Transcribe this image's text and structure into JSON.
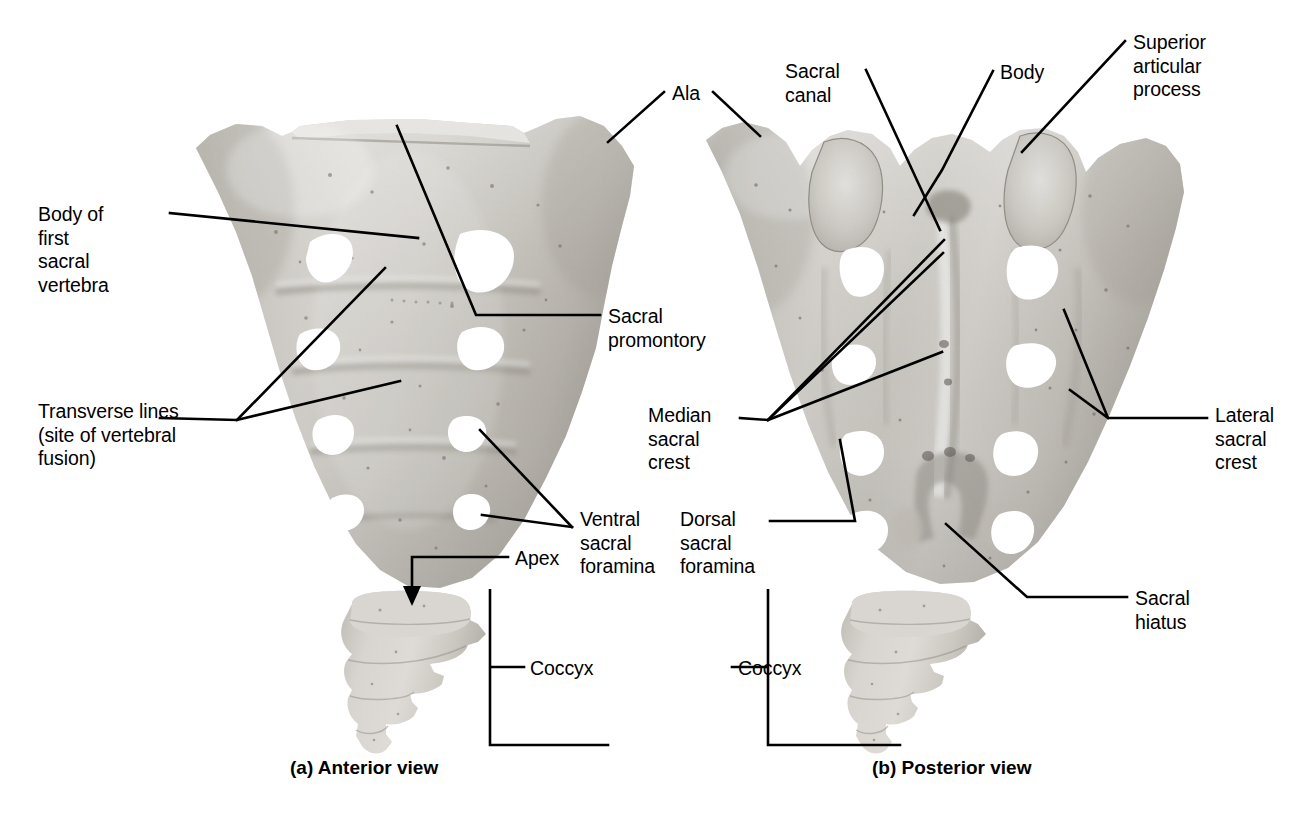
{
  "figure": {
    "background_color": "#ffffff",
    "line_color": "#000000",
    "bone_color": "#c9c6c0",
    "bone_shadow_color": "#9a968f",
    "bone_highlight_color": "#e2e0db",
    "foramen_color": "#ffffff"
  },
  "panels": [
    {
      "id": "anterior",
      "caption": "(a) Anterior view",
      "caption_x": 290,
      "caption_y": 757
    },
    {
      "id": "posterior",
      "caption": "(b) Posterior view",
      "caption_x": 872,
      "caption_y": 757
    }
  ],
  "labels": [
    {
      "name": "body-of-first-sacral-vertebra",
      "text": "Body of\nfirst\nsacral\nvertebra",
      "x": 38,
      "y": 203,
      "align": "left",
      "panel": "anterior"
    },
    {
      "name": "transverse-lines",
      "text": "Transverse lines\n(site of vertebral\nfusion)",
      "x": 38,
      "y": 400,
      "align": "left",
      "panel": "anterior"
    },
    {
      "name": "sacral-promontory",
      "text": "Sacral\npromontory",
      "x": 608,
      "y": 305,
      "align": "left",
      "panel": "anterior"
    },
    {
      "name": "ventral-sacral-foramina",
      "text": "Ventral\nsacral\nforamina",
      "x": 580,
      "y": 508,
      "align": "left",
      "panel": "anterior"
    },
    {
      "name": "apex",
      "text": "Apex",
      "x": 515,
      "y": 547,
      "align": "left",
      "panel": "anterior"
    },
    {
      "name": "coccyx-anterior",
      "text": "Coccyx",
      "x": 530,
      "y": 657,
      "align": "left",
      "panel": "anterior"
    },
    {
      "name": "ala",
      "text": "Ala",
      "x": 672,
      "y": 82,
      "align": "left",
      "panel": "shared"
    },
    {
      "name": "sacral-canal",
      "text": "Sacral\ncanal",
      "x": 785,
      "y": 60,
      "align": "left",
      "panel": "posterior"
    },
    {
      "name": "body",
      "text": "Body",
      "x": 1000,
      "y": 61,
      "align": "left",
      "panel": "posterior"
    },
    {
      "name": "superior-articular-process",
      "text": "Superior\narticular\nprocess",
      "x": 1133,
      "y": 31,
      "align": "left",
      "panel": "posterior"
    },
    {
      "name": "median-sacral-crest",
      "text": "Median\nsacral\ncrest",
      "x": 648,
      "y": 404,
      "align": "left",
      "panel": "posterior"
    },
    {
      "name": "lateral-sacral-crest",
      "text": "Lateral\nsacral\ncrest",
      "x": 1215,
      "y": 404,
      "align": "left",
      "panel": "posterior"
    },
    {
      "name": "dorsal-sacral-foramina",
      "text": "Dorsal\nsacral\nforamina",
      "x": 680,
      "y": 508,
      "align": "left",
      "panel": "posterior"
    },
    {
      "name": "sacral-hiatus",
      "text": "Sacral\nhiatus",
      "x": 1135,
      "y": 587,
      "align": "left",
      "panel": "posterior"
    },
    {
      "name": "coccyx-posterior",
      "text": "Coccyx",
      "x": 738,
      "y": 657,
      "align": "left",
      "panel": "posterior"
    }
  ],
  "leader_lines": [
    {
      "name": "leader-body-of-first-sacral-vertebra",
      "points": "170,213 418,238"
    },
    {
      "name": "leader-transverse-lines-a",
      "points": "160,418 237,420 385,268"
    },
    {
      "name": "leader-transverse-lines-b",
      "points": "237,420 400,381"
    },
    {
      "name": "leader-sacral-promontory",
      "points": "600,315 476,315 397,126"
    },
    {
      "name": "leader-ventral-sacral-foramina-upper",
      "points": "572,527 480,430"
    },
    {
      "name": "leader-ventral-sacral-foramina-lower",
      "points": "572,527 482,515"
    },
    {
      "name": "leader-apex",
      "points": "508,557 412,557 412,592"
    },
    {
      "name": "leader-ala-left",
      "points": "664,92 608,142"
    },
    {
      "name": "leader-ala-right",
      "points": "713,92 760,136"
    },
    {
      "name": "leader-sacral-canal",
      "points": "866,70 940,230"
    },
    {
      "name": "leader-body",
      "points": "993,71 942,170 914,215"
    },
    {
      "name": "leader-superior-articular-process",
      "points": "1125,41 1022,152"
    },
    {
      "name": "leader-median-sacral-crest-1",
      "points": "740,418 768,420 944,240"
    },
    {
      "name": "leader-median-sacral-crest-2",
      "points": "768,420 943,253"
    },
    {
      "name": "leader-median-sacral-crest-3",
      "points": "768,420 942,352"
    },
    {
      "name": "leader-lateral-sacral-crest-upper",
      "points": "1207,418 1108,418 1064,310"
    },
    {
      "name": "leader-lateral-sacral-crest-lower",
      "points": "1108,418 1070,390"
    },
    {
      "name": "leader-dorsal-sacral-foramina",
      "points": "770,521 855,521 840,440"
    },
    {
      "name": "leader-sacral-hiatus",
      "points": "1127,597 1027,597 946,524"
    },
    {
      "name": "bracket-coccyx-anterior",
      "points": "524,667 490,667 490,589 490,745 608,745"
    },
    {
      "name": "bracket-coccyx-posterior",
      "points": "732,667 768,667 768,589 768,745 900,745"
    }
  ],
  "arrows": [
    {
      "name": "apex-arrowhead",
      "x": 412,
      "y": 600,
      "direction": "down"
    }
  ],
  "bones": [
    {
      "name": "sacrum-anterior",
      "view": "anterior",
      "foramina_pairs": 4,
      "segments": 5
    },
    {
      "name": "coccyx-anterior",
      "view": "anterior",
      "segments": 4
    },
    {
      "name": "sacrum-posterior",
      "view": "posterior",
      "foramina_pairs": 4,
      "segments": 5
    },
    {
      "name": "coccyx-posterior",
      "view": "posterior",
      "segments": 4
    }
  ]
}
